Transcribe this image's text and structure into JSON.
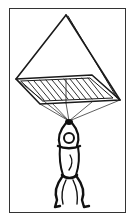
{
  "figure": {
    "colors": {
      "background": "#ffffff",
      "ink": "#1a1a1a",
      "frame": "#333333"
    }
  }
}
